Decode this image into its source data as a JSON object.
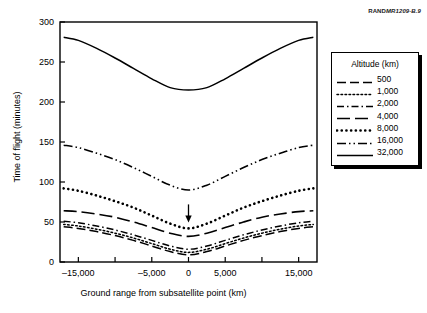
{
  "credit": {
    "prefix": "RAND",
    "number": "MR1209-B.9"
  },
  "legend": {
    "title": "Altitude (km)",
    "position": "right-outside",
    "entries": [
      {
        "label": "500",
        "style": "long-dash"
      },
      {
        "label": "1,000",
        "style": "fine-dotted"
      },
      {
        "label": "2,000",
        "style": "dash-dot"
      },
      {
        "label": "4,000",
        "style": "long-dash-wide"
      },
      {
        "label": "8,000",
        "style": "thick-dotted"
      },
      {
        "label": "16,000",
        "style": "dash-dot-dot"
      },
      {
        "label": "32,000",
        "style": "solid"
      }
    ]
  },
  "annotations": [
    {
      "type": "arrow-down",
      "x": 0,
      "y": 72,
      "target_series": "8,000"
    }
  ],
  "chart_data": {
    "type": "line",
    "title": "",
    "xlabel": "Ground range from subsatellite point (km)",
    "ylabel": "Time of flight (minutes)",
    "xlim": [
      -17500,
      17500
    ],
    "ylim": [
      0,
      300
    ],
    "grid": false,
    "xticks": [
      -15000,
      -10000,
      -5000,
      0,
      5000,
      10000,
      15000
    ],
    "xticklabels": [
      "–15,000",
      "",
      "–5,000",
      "0",
      "5,000",
      "",
      "15,000"
    ],
    "yticks": [
      0,
      50,
      100,
      150,
      200,
      250,
      300
    ],
    "yticklabels": [
      "0",
      "50",
      "100",
      "150",
      "200",
      "250",
      "300"
    ],
    "x": [
      -17000,
      -15000,
      -12500,
      -10000,
      -7500,
      -5000,
      -2500,
      0,
      2500,
      5000,
      7500,
      10000,
      12500,
      15000,
      17000
    ],
    "series": [
      {
        "name": "500",
        "style": "long-dash",
        "values": [
          44,
          42,
          38,
          33,
          27,
          20,
          13,
          9,
          13,
          20,
          27,
          33,
          38,
          42,
          44
        ]
      },
      {
        "name": "1,000",
        "style": "fine-dotted",
        "values": [
          47,
          45,
          41,
          36,
          30,
          23,
          16,
          12,
          16,
          23,
          30,
          36,
          41,
          45,
          47
        ]
      },
      {
        "name": "2,000",
        "style": "dash-dot",
        "values": [
          51,
          49,
          45,
          40,
          34,
          27,
          20,
          16,
          20,
          27,
          34,
          40,
          45,
          49,
          51
        ]
      },
      {
        "name": "4,000",
        "style": "long-dash-wide",
        "values": [
          64,
          63,
          60,
          56,
          50,
          43,
          36,
          32,
          36,
          43,
          50,
          56,
          60,
          63,
          64
        ]
      },
      {
        "name": "8,000",
        "style": "thick-dotted",
        "values": [
          92,
          89,
          83,
          76,
          68,
          58,
          48,
          42,
          48,
          58,
          68,
          76,
          83,
          89,
          92
        ]
      },
      {
        "name": "16,000",
        "style": "dash-dot-dot",
        "values": [
          146,
          143,
          136,
          128,
          118,
          107,
          96,
          90,
          96,
          107,
          118,
          128,
          136,
          143,
          146
        ]
      },
      {
        "name": "32,000",
        "style": "solid",
        "values": [
          281,
          277,
          267,
          255,
          242,
          229,
          218,
          215,
          218,
          229,
          242,
          255,
          267,
          277,
          281
        ]
      }
    ]
  }
}
